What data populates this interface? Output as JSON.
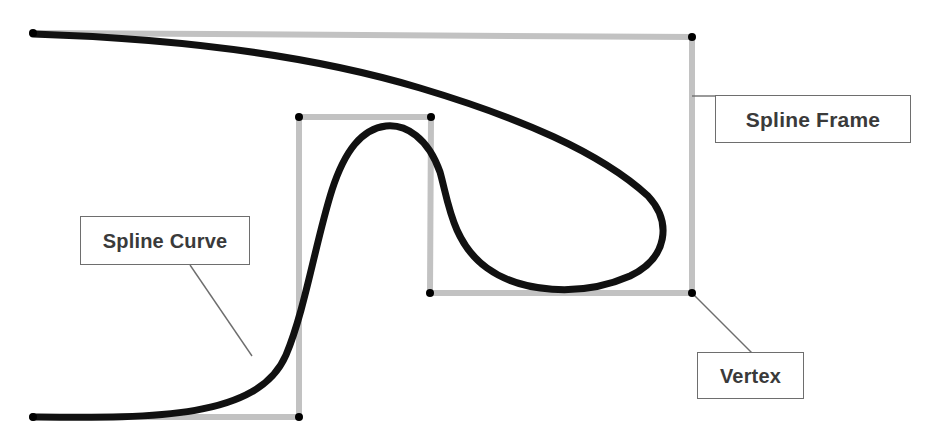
{
  "diagram": {
    "background_color": "#ffffff",
    "frame_color": "#c2c2c2",
    "curve_color": "#111111",
    "vertex_color": "#000000",
    "leader_color": "#6e6e6e",
    "callout_border_color": "#6e6e6e",
    "callout_text_color": "#3a3a3a",
    "frame_stroke_width": 6,
    "curve_stroke_width": 7,
    "leader_stroke_width": 1.4,
    "vertex_radius": 4
  },
  "callouts": [
    {
      "id": "spline-frame",
      "label": "Spline Frame",
      "points_to": "frame-top-right-vertex"
    },
    {
      "id": "spline-curve",
      "label": "Spline Curve",
      "points_to": "curve-lower-left-segment"
    },
    {
      "id": "vertex",
      "label": "Vertex",
      "points_to": "frame-bottom-right-vertex"
    }
  ],
  "vertices": [
    {
      "name": "frame-top-left-start",
      "x": 33,
      "y": 33
    },
    {
      "name": "frame-top-right-vertex",
      "x": 692,
      "y": 37
    },
    {
      "name": "frame-bottom-right-vertex",
      "x": 692,
      "y": 293
    },
    {
      "name": "inner-frame-bottom-right",
      "x": 430,
      "y": 293
    },
    {
      "name": "inner-frame-top-right",
      "x": 431,
      "y": 117
    },
    {
      "name": "inner-frame-top-left",
      "x": 299,
      "y": 117
    },
    {
      "name": "inner-frame-bottom-left",
      "x": 299,
      "y": 417
    },
    {
      "name": "frame-bottom-left-start",
      "x": 33,
      "y": 417
    }
  ],
  "frame_path": "M33,33 L692,37 L692,293 L430,293 L431,117 L299,117 L299,417 L33,417",
  "curve_path": "M33,34 C160,38 300,52 420,88 C520,118 600,152 648,196 C672,222 668,258 630,276 C580,298 520,292 487,268 C452,243 448,200 440,172 C428,138 406,124 386,126 C362,129 345,150 332,190 C316,240 305,310 286,355 C258,420 150,418 33,417",
  "leaders": [
    {
      "name": "spline-frame-leader",
      "path": "M692,96 L719,96"
    },
    {
      "name": "spline-curve-leader",
      "path": "M190,265 L252,356"
    },
    {
      "name": "vertex-leader",
      "path": "M693,294 L752,353"
    }
  ]
}
